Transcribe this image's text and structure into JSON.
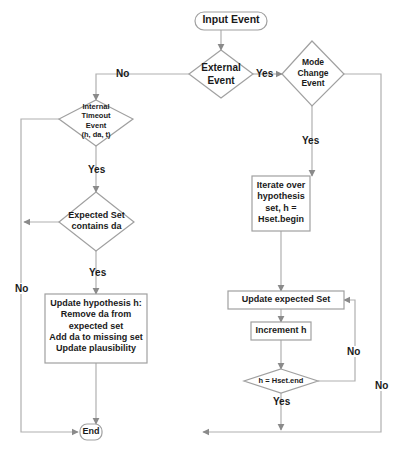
{
  "diagram": {
    "type": "flowchart",
    "colors": {
      "line": "#b0b0b0",
      "arrow": "#8a8a8a",
      "node_border": "#a0a0a0",
      "text": "#1a1a1a",
      "background": "#ffffff"
    },
    "nodes": {
      "input_event": "Input Event",
      "external_event": [
        "External",
        "Event"
      ],
      "mode_change_event": [
        "Mode",
        "Change",
        "Event"
      ],
      "internal_timeout_event": [
        "Internal",
        "Timeout",
        "Event",
        "(h, da, t)"
      ],
      "expected_set_contains": [
        "Expected Set",
        "contains da"
      ],
      "update_hypothesis": [
        "Update hypothesis h:",
        "Remove da from",
        "expected set",
        "Add da to missing set",
        "Update plausibility"
      ],
      "iterate_hypothesis": [
        "Iterate over",
        "hypothesis",
        "set, h =",
        "Hset.begin"
      ],
      "update_expected_set": "Update expected Set",
      "increment_h": "Increment h",
      "h_equals_end": "h = Hset.end",
      "end": "End"
    },
    "edge_labels": {
      "external_yes": "Yes",
      "external_no": "No",
      "mode_yes": "Yes",
      "mode_no": "No",
      "internal_yes": "Yes",
      "internal_no": "No",
      "expected_yes": "Yes",
      "loop_no": "No",
      "loop_yes": "Yes"
    }
  }
}
